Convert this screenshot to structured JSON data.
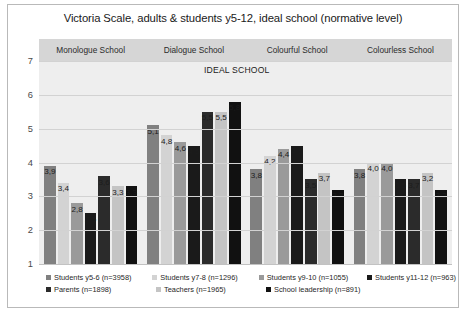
{
  "chart_data": {
    "type": "bar",
    "title": "Victoria Scale, adults & students y5-12, ideal school (normative level)",
    "annotation": "IDEAL SCHOOL",
    "xlabel": "",
    "ylabel": "",
    "ylim": [
      1,
      7
    ],
    "yticks": [
      "7",
      "6",
      "5",
      "4",
      "3",
      "2",
      "1"
    ],
    "grid": true,
    "legend_position": "bottom",
    "categories": [
      "Monologue School",
      "Dialogue School",
      "Colourful School",
      "Colourless School"
    ],
    "series": [
      {
        "name": "Students y5-6 (n=3958)",
        "color": "#808080",
        "values": [
          3.9,
          5.1,
          3.8,
          3.8
        ]
      },
      {
        "name": "Students y7-8 (n=1296)",
        "color": "#d3d3d3",
        "values": [
          3.4,
          4.8,
          4.2,
          4.0
        ]
      },
      {
        "name": "Students y9-10 (n=1055)",
        "color": "#9a9a9a",
        "values": [
          2.8,
          4.6,
          4.4,
          4.0
        ]
      },
      {
        "name": "Students y11-12 (n=963)",
        "color": "#1a1a1a",
        "values": [
          2.5,
          4.5,
          4.5,
          3.5
        ]
      },
      {
        "name": "Parents (n=1898)",
        "color": "#2b2b2b",
        "values": [
          3.6,
          5.5,
          3.5,
          3.5
        ]
      },
      {
        "name": "Teachers (n=1965)",
        "color": "#c4c4c4",
        "values": [
          3.3,
          5.5,
          3.7,
          3.7
        ]
      },
      {
        "name": "School leadership (n=891)",
        "color": "#111111",
        "values": [
          3.3,
          5.8,
          3.2,
          3.2
        ]
      }
    ],
    "value_labels": {
      "Monologue School": [
        "3,9",
        "3,4",
        "2,8",
        "2,5",
        "3,6",
        "3,3",
        "3,3"
      ],
      "Dialogue School": [
        "5,1",
        "4,8",
        "4,6",
        "4,5",
        "5,5",
        "5,5",
        "5,8"
      ],
      "Colourful School": [
        "3,8",
        "4,2",
        "4,4",
        "4,5",
        "3,5",
        "3,7",
        "3,2"
      ],
      "Colourless School": [
        "3,8",
        "4,0",
        "4,0",
        "3,5",
        "3,7",
        "3,2",
        "3,2"
      ]
    }
  },
  "legend": {
    "row1": [
      "Students y5-6 (n=3958)",
      "Students y7-8 (n=1296)",
      "Students y9-10 (n=1055)",
      "Students y11-12 (n=963)"
    ],
    "row2": [
      "Parents (n=1898)",
      "Teachers (n=1965)",
      "School leadership (n=891)"
    ]
  }
}
